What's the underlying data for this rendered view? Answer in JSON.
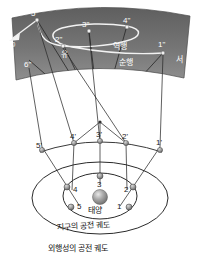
{
  "figure": {
    "colors": {
      "sky_band_dark": "#6e6e6e",
      "sky_band_light": "#8a8a8a",
      "line": "#2b2b2b",
      "node_fill": "#9a9a9a",
      "sun_fill": "#8d8d8d",
      "white": "#ffffff",
      "text_dark": "#1a1a1a"
    }
  },
  "sky_band": {
    "name": "celestial-sphere-band",
    "direction_left": "동",
    "direction_right": "서",
    "motion_retrograde": "역행",
    "motion_prograde": "순행",
    "stationary": "유",
    "positions": [
      {
        "label": "1\"",
        "x": 164,
        "y": 49
      },
      {
        "label": "2\"",
        "x": 63,
        "y": 42
      },
      {
        "label": "3\"",
        "x": 88,
        "y": 27
      },
      {
        "label": "4\"",
        "x": 128,
        "y": 25
      },
      {
        "label": "5\"",
        "x": 36,
        "y": 15
      },
      {
        "label": "6\"",
        "x": 29,
        "y": 63
      }
    ],
    "arrow_label": "east-motion-arrow"
  },
  "outer_orbit_row": {
    "name": "outer-planet-positions",
    "positions": [
      {
        "label": "1'",
        "x": 160,
        "y": 144
      },
      {
        "label": "2'",
        "x": 126,
        "y": 140
      },
      {
        "label": "3'",
        "x": 100,
        "y": 139
      },
      {
        "label": "4'",
        "x": 74,
        "y": 140
      },
      {
        "label": "5'",
        "x": 42,
        "y": 145
      }
    ]
  },
  "earth_orbit": {
    "name": "earth-orbit-ellipse",
    "caption": "지구의 공전 궤도",
    "sun_label": "태양",
    "positions": [
      {
        "label": "1",
        "x": 120,
        "y": 205
      },
      {
        "label": "2",
        "x": 127,
        "y": 189
      },
      {
        "label": "3",
        "x": 100,
        "y": 183
      },
      {
        "label": "4",
        "x": 72,
        "y": 189
      },
      {
        "label": "5",
        "x": 79,
        "y": 205
      }
    ]
  },
  "outer_orbit_ellipse": {
    "name": "outer-planet-orbit-ellipse",
    "caption": "외행성의 공전 궤도"
  }
}
